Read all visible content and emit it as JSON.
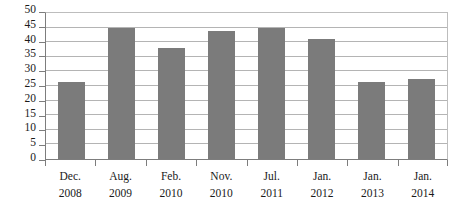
{
  "chart_data": {
    "type": "bar",
    "title": "",
    "subtitle": "",
    "xlabel": "",
    "ylabel": "",
    "categories": [
      "Dec. 2008",
      "Aug. 2009",
      "Feb. 2010",
      "Nov. 2010",
      "Jul. 2011",
      "Jan. 2012",
      "Jan. 2013",
      "Jan. 2014"
    ],
    "category_lines": [
      [
        "Dec.",
        "2008"
      ],
      [
        "Aug.",
        "2009"
      ],
      [
        "Feb.",
        "2010"
      ],
      [
        "Nov.",
        "2010"
      ],
      [
        "Jul.",
        "2011"
      ],
      [
        "Jan.",
        "2012"
      ],
      [
        "Jan.",
        "2013"
      ],
      [
        "Jan.",
        "2014"
      ]
    ],
    "values": [
      26.5,
      45,
      38,
      44,
      45,
      41,
      26.5,
      27.5
    ],
    "ylim": [
      0,
      50
    ],
    "ytick_labels": [
      "0",
      "5",
      "10",
      "15",
      "20",
      "25",
      "30",
      "35",
      "40",
      "45",
      "50"
    ],
    "ytick_values": [
      0,
      5,
      10,
      15,
      20,
      25,
      30,
      35,
      40,
      45,
      50
    ],
    "grid": true,
    "legend": false,
    "legend_position": "none",
    "bar_color": "#7b7b7b",
    "grid_color": "#b4b4b4",
    "axis_color": "#7d7d7d",
    "background_color": "#ffffff",
    "text_color": "#1a1a1a"
  }
}
